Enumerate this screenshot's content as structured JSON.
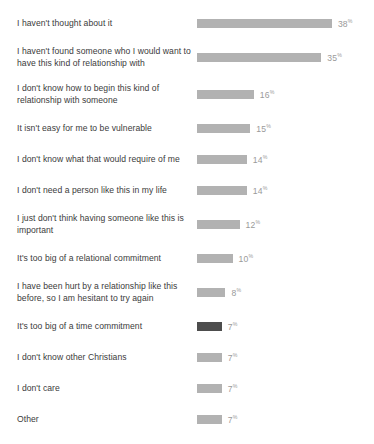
{
  "chart_data": {
    "type": "bar",
    "title": "",
    "subtitle": "",
    "xlabel": "",
    "ylabel": "",
    "orientation": "horizontal",
    "grid": false,
    "legend": false,
    "value_suffix": "%",
    "xlim": [
      0,
      38
    ],
    "colors": {
      "bar": "#b2b2b2",
      "bar_highlight": "#4d4d4d",
      "label_text": "#3b3b3b",
      "value_text": "#9a9a9a",
      "background": "#ffffff"
    },
    "categories": [
      "I haven't thought about it",
      "I haven't found someone who I would want to have this kind of relationship with",
      "I don't know how to begin this kind of relationship with someone",
      "It isn't easy for me to be vulnerable",
      "I don't know what that would require of me",
      "I don't need a person like this in my life",
      "I just don't think having someone like this is important",
      "It's too big of a relational commitment",
      "I have been hurt by a relationship like this before, so I am hesitant to try again",
      "It's too big of a time commitment",
      "I don't know other Christians",
      "I don't care",
      "Other"
    ],
    "values": [
      38,
      35,
      16,
      15,
      14,
      14,
      12,
      10,
      8,
      7,
      7,
      7,
      7
    ],
    "value_labels": [
      "38",
      "35",
      "16",
      "15",
      "14",
      "14",
      "12",
      "10",
      "8",
      "7",
      "7",
      "7",
      "7"
    ],
    "highlighted": [
      false,
      false,
      false,
      false,
      false,
      false,
      false,
      false,
      false,
      true,
      false,
      false,
      false
    ]
  }
}
